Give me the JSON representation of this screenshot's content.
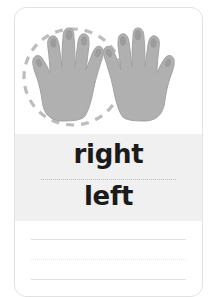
{
  "card": {
    "title": "right and left hands worksheet card",
    "border_color": "#e2e2e2",
    "background": "#ffffff"
  },
  "illustration": {
    "name": "two-hands-illustration",
    "hand_fill": "#b0b0b0",
    "hand_stroke": "#9a9a9a",
    "nail_fill": "#9c9c9c",
    "left_hand": {
      "label": "left hand palm image",
      "circled": true,
      "thumb_side": "left"
    },
    "right_hand": {
      "label": "right hand palm image",
      "circled": false,
      "thumb_side": "right"
    },
    "selection_circle": {
      "name": "dashed-selection-circle",
      "color": "#bdbdbd",
      "style": "dashed"
    }
  },
  "answers": {
    "band_color": "#f0f0f0",
    "option_right": "right",
    "option_left": "left",
    "divider_style": "dotted",
    "divider_color": "#b9b9b9"
  },
  "writing_lines": {
    "count": 3,
    "styles": [
      "solid",
      "dotted",
      "solid"
    ],
    "color": "#e0e0e0"
  }
}
